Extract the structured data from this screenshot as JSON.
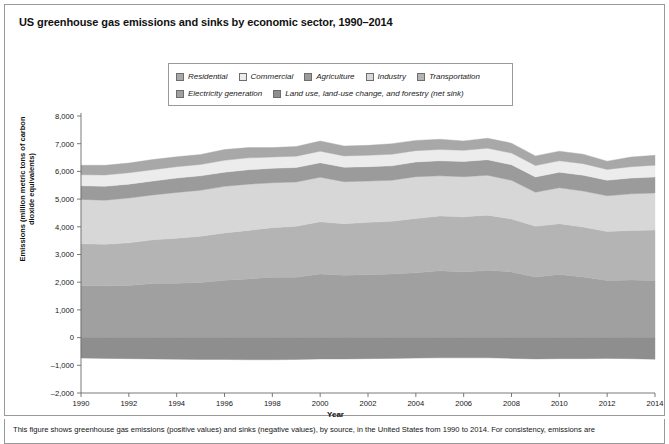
{
  "figure": {
    "title": "US greenhouse gas emissions and sinks by economic sector, 1990–2014",
    "caption": "This figure shows greenhouse gas emissions (positive values) and sinks (negative values), by source, in the United States from 1990 to 2014. For consistency, emissions are"
  },
  "legend": {
    "row1": [
      {
        "label": "Residential",
        "color": "#a8a8a8"
      },
      {
        "label": "Commercial",
        "color": "#ececec"
      },
      {
        "label": "Agriculture",
        "color": "#9b9b9b"
      },
      {
        "label": "Industry",
        "color": "#d7d7d7"
      },
      {
        "label": "Transportation",
        "color": "#b4b4b4"
      }
    ],
    "row2": [
      {
        "label": "Electricity generation",
        "color": "#a0a0a0"
      },
      {
        "label": "Land use, land-use change, and forestry (net sink)",
        "color": "#8e8e8e"
      }
    ]
  },
  "chart_data": {
    "type": "area",
    "stacked": true,
    "title": "US greenhouse gas emissions and sinks by economic sector, 1990–2014",
    "xlabel": "Year",
    "ylabel": "Emissions (million metric tons of carbon dioxide equivalents)",
    "xlim": [
      1990,
      2014
    ],
    "ylim": [
      -2000,
      8000
    ],
    "ytick_step": 1000,
    "yticks": [
      "8,000",
      "7,000",
      "6,000",
      "5,000",
      "4,000",
      "3,000",
      "2,000",
      "1,000",
      "0",
      "–1,000",
      "–2,000"
    ],
    "ytick_values": [
      8000,
      7000,
      6000,
      5000,
      4000,
      3000,
      2000,
      1000,
      0,
      -1000,
      -2000
    ],
    "xticks": [
      1990,
      1992,
      1994,
      1996,
      1998,
      2000,
      2002,
      2004,
      2006,
      2008,
      2010,
      2012,
      2014
    ],
    "xtick_labels": [
      "1990",
      "1992",
      "1994",
      "1996",
      "1998",
      "2000",
      "2002",
      "2004",
      "2006",
      "2008",
      "2010",
      "2012",
      "2014"
    ],
    "grid": false,
    "legend_position": "top-center",
    "x": [
      1990,
      1991,
      1992,
      1993,
      1994,
      1995,
      1996,
      1997,
      1998,
      1999,
      2000,
      2001,
      2002,
      2003,
      2004,
      2005,
      2006,
      2007,
      2008,
      2009,
      2010,
      2011,
      2012,
      2013,
      2014
    ],
    "series": [
      {
        "name": "Electricity generation",
        "color": "#a0a0a0",
        "order": 1,
        "values": [
          1870,
          1870,
          1880,
          1950,
          1960,
          1990,
          2070,
          2120,
          2180,
          2180,
          2300,
          2250,
          2270,
          2300,
          2340,
          2410,
          2370,
          2430,
          2370,
          2190,
          2280,
          2190,
          2060,
          2080,
          2060
        ]
      },
      {
        "name": "Transportation",
        "color": "#b4b4b4",
        "order": 2,
        "values": [
          1520,
          1500,
          1540,
          1580,
          1630,
          1670,
          1710,
          1750,
          1790,
          1840,
          1880,
          1860,
          1890,
          1900,
          1960,
          1980,
          1990,
          1990,
          1910,
          1830,
          1830,
          1800,
          1770,
          1790,
          1820
        ]
      },
      {
        "name": "Industry",
        "color": "#d7d7d7",
        "order": 3,
        "values": [
          1600,
          1590,
          1620,
          1620,
          1650,
          1660,
          1680,
          1670,
          1620,
          1600,
          1610,
          1520,
          1490,
          1480,
          1510,
          1450,
          1450,
          1440,
          1400,
          1230,
          1300,
          1300,
          1290,
          1320,
          1340
        ]
      },
      {
        "name": "Agriculture",
        "color": "#9b9b9b",
        "order": 4,
        "values": [
          490,
          500,
          500,
          500,
          520,
          520,
          510,
          520,
          520,
          520,
          520,
          520,
          520,
          520,
          530,
          540,
          550,
          560,
          560,
          550,
          560,
          570,
          560,
          570,
          580
        ]
      },
      {
        "name": "Commercial",
        "color": "#ececec",
        "order": 5,
        "values": [
          400,
          410,
          410,
          410,
          410,
          410,
          430,
          430,
          410,
          410,
          420,
          410,
          410,
          420,
          410,
          410,
          400,
          420,
          420,
          410,
          410,
          420,
          390,
          410,
          420
        ]
      },
      {
        "name": "Residential",
        "color": "#a8a8a8",
        "order": 6,
        "values": [
          340,
          350,
          350,
          370,
          360,
          360,
          390,
          370,
          340,
          350,
          370,
          360,
          360,
          380,
          370,
          370,
          340,
          360,
          360,
          350,
          350,
          340,
          300,
          350,
          360
        ]
      },
      {
        "name": "Land use, land-use change, and forestry (net sink)",
        "color": "#8e8e8e",
        "order": 0,
        "negative": true,
        "values": [
          -740,
          -750,
          -760,
          -770,
          -780,
          -790,
          -790,
          -800,
          -800,
          -790,
          -770,
          -770,
          -760,
          -750,
          -740,
          -730,
          -730,
          -730,
          -750,
          -770,
          -760,
          -760,
          -750,
          -760,
          -780
        ]
      }
    ]
  }
}
